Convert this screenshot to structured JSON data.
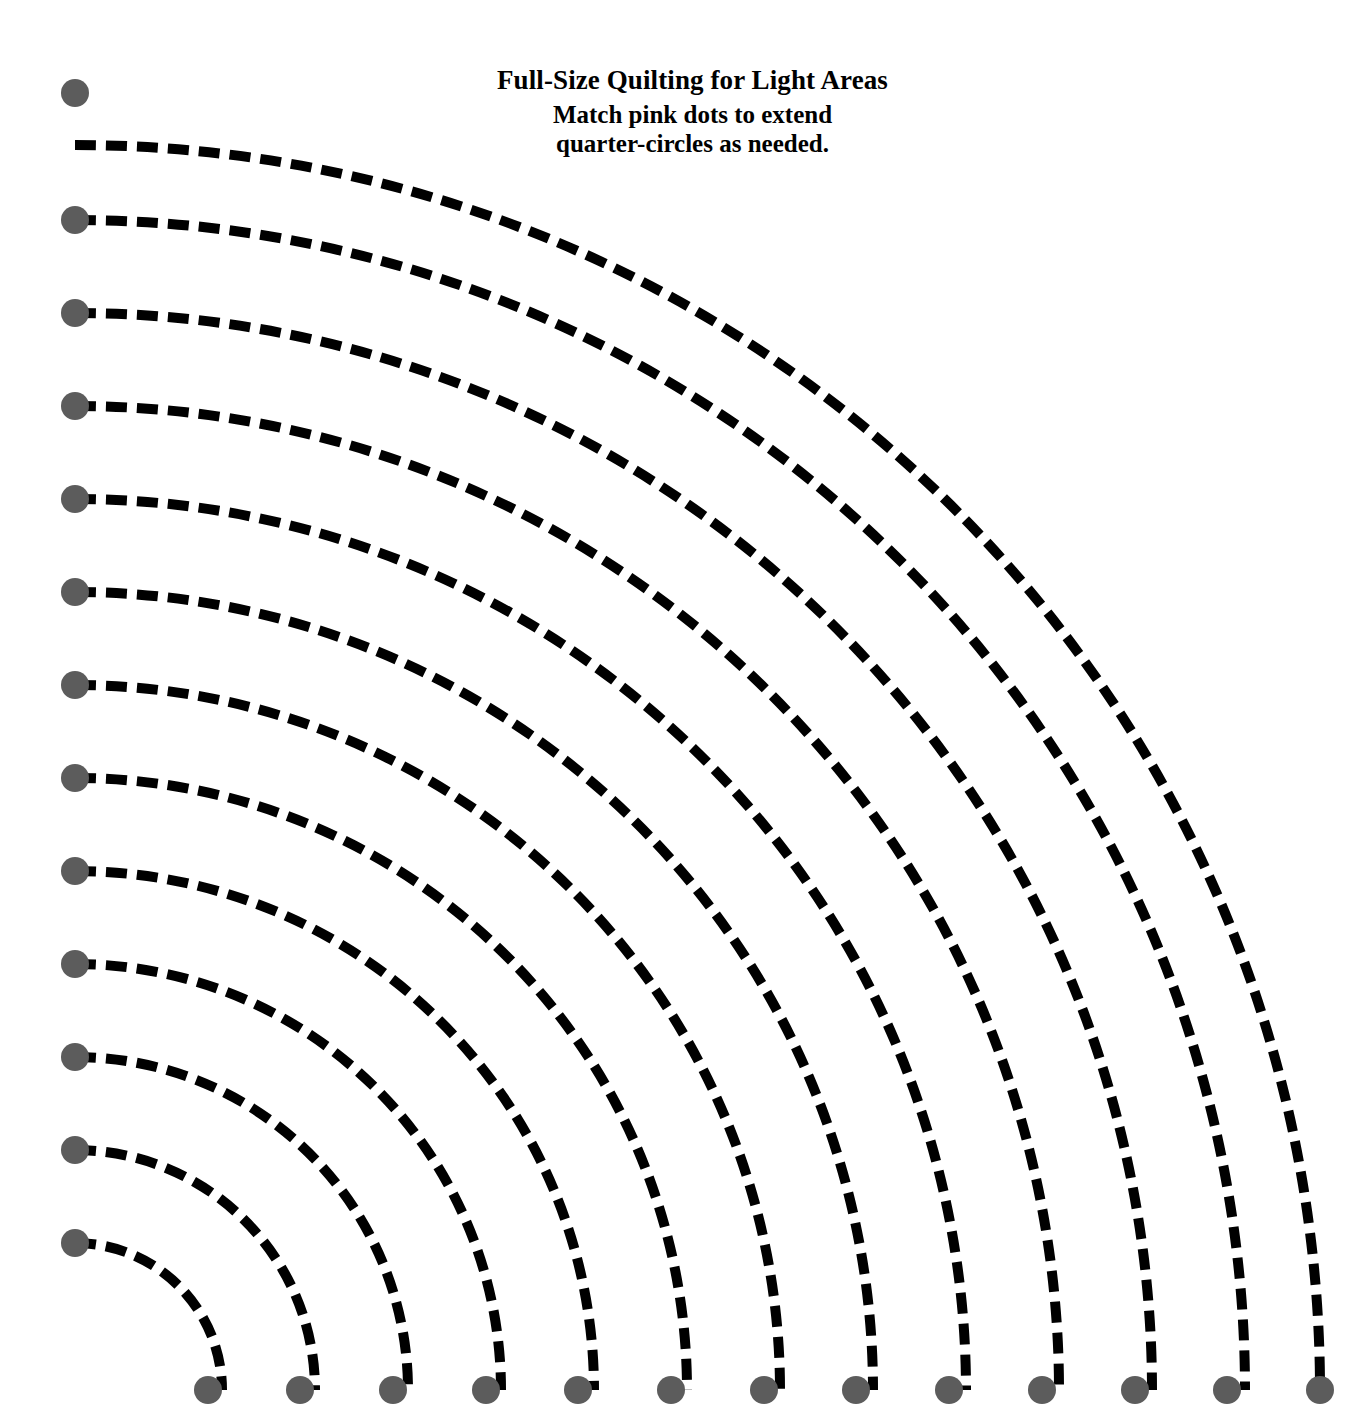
{
  "page": {
    "background_color": "#ffffff",
    "width": 1370,
    "height": 1423
  },
  "caption": {
    "title": "Full-Size Quilting for Light Areas",
    "subtitle_line1": "Match pink dots to extend",
    "subtitle_line2": "quarter-circles as needed.",
    "text_color": "#000000"
  },
  "pattern": {
    "description": "Nested dashed quarter-circle arcs radiating from a common center at the lower-left corner, each arc terminated at both ends by a round registration dot.",
    "center": {
      "x": 75,
      "y": 1390
    },
    "arc_color": "#000000",
    "arc_stroke_width": 10,
    "dash_length": 21,
    "dash_gap": 10,
    "dot_color": "#5c5c5c",
    "dot_radius": 14,
    "arc_count": 13,
    "radii": [
      147,
      240,
      333,
      426,
      519,
      612,
      705,
      798,
      891,
      984,
      1077,
      1170,
      1245
    ],
    "left_dot_y": [
      1243,
      1150,
      1057,
      964,
      871,
      778,
      685,
      592,
      499,
      406,
      313,
      220,
      93
    ],
    "left_dot_x": 75,
    "bottom_dot_y": 1390,
    "bottom_dot_x": [
      208,
      300,
      393,
      486,
      578,
      671,
      764,
      856,
      949,
      1042,
      1135,
      1227,
      1320
    ]
  },
  "chart_data": {
    "type": "line",
    "title": "Full-Size Quilting for Light Areas",
    "subtitle": "Match pink dots to extend quarter-circles as needed.",
    "xlabel": "",
    "ylabel": "",
    "xlim": [
      0,
      1370
    ],
    "ylim": [
      0,
      1423
    ],
    "grid": false,
    "legend": null,
    "series": [
      {
        "name": "arc-1",
        "radius": 147,
        "start_point": [
          75,
          1243
        ],
        "end_point": [
          208,
          1390
        ]
      },
      {
        "name": "arc-2",
        "radius": 240,
        "start_point": [
          75,
          1150
        ],
        "end_point": [
          300,
          1390
        ]
      },
      {
        "name": "arc-3",
        "radius": 333,
        "start_point": [
          75,
          1057
        ],
        "end_point": [
          393,
          1390
        ]
      },
      {
        "name": "arc-4",
        "radius": 426,
        "start_point": [
          75,
          964
        ],
        "end_point": [
          486,
          1390
        ]
      },
      {
        "name": "arc-5",
        "radius": 519,
        "start_point": [
          75,
          871
        ],
        "end_point": [
          578,
          1390
        ]
      },
      {
        "name": "arc-6",
        "radius": 612,
        "start_point": [
          75,
          778
        ],
        "end_point": [
          671,
          1390
        ]
      },
      {
        "name": "arc-7",
        "radius": 705,
        "start_point": [
          75,
          685
        ],
        "end_point": [
          764,
          1390
        ]
      },
      {
        "name": "arc-8",
        "radius": 798,
        "start_point": [
          75,
          592
        ],
        "end_point": [
          856,
          1390
        ]
      },
      {
        "name": "arc-9",
        "radius": 891,
        "start_point": [
          75,
          499
        ],
        "end_point": [
          949,
          1390
        ]
      },
      {
        "name": "arc-10",
        "radius": 984,
        "start_point": [
          75,
          406
        ],
        "end_point": [
          1042,
          1390
        ]
      },
      {
        "name": "arc-11",
        "radius": 1077,
        "start_point": [
          75,
          313
        ],
        "end_point": [
          1135,
          1390
        ]
      },
      {
        "name": "arc-12",
        "radius": 1170,
        "start_point": [
          75,
          220
        ],
        "end_point": [
          1227,
          1390
        ]
      },
      {
        "name": "arc-13",
        "radius": 1245,
        "start_point": [
          75,
          93
        ],
        "end_point": [
          1320,
          1390
        ]
      }
    ]
  }
}
